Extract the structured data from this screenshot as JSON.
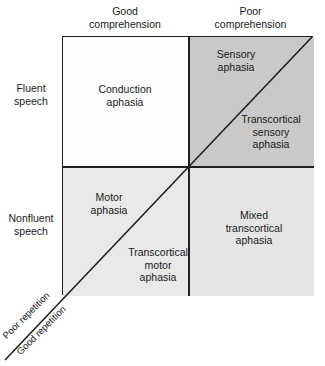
{
  "diagram": {
    "columns": [
      {
        "id": "good-comprehension",
        "label": "Good\ncomprehension"
      },
      {
        "id": "poor-comprehension",
        "label": "Poor\ncomprehension"
      }
    ],
    "rows": [
      {
        "id": "fluent-speech",
        "label": "Fluent\nspeech"
      },
      {
        "id": "nonfluent-speech",
        "label": "Nonfluent\nspeech"
      }
    ],
    "diagonal_axis": {
      "upper_label": "Poor repetition",
      "lower_label": "Good repetition"
    },
    "cells": [
      {
        "id": "conduction-aphasia",
        "label": "Conduction\naphasia",
        "row": "fluent-speech",
        "column": "good-comprehension",
        "repetition": "poor",
        "shade": "#fdfdfd"
      },
      {
        "id": "sensory-aphasia",
        "label": "Sensory\naphasia",
        "row": "fluent-speech",
        "column": "poor-comprehension",
        "repetition": "poor",
        "shade": "#c9c9c9"
      },
      {
        "id": "transcortical-sensory-aphasia",
        "label": "Transcortical\nsensory\naphasia",
        "row": "fluent-speech",
        "column": "poor-comprehension",
        "repetition": "good",
        "shade": "#c9c9c9"
      },
      {
        "id": "motor-aphasia",
        "label": "Motor\naphasia",
        "row": "nonfluent-speech",
        "column": "good-comprehension",
        "repetition": "poor",
        "shade": "#e9e9e9"
      },
      {
        "id": "transcortical-motor-aphasia",
        "label": "Transcortical\nmotor\naphasia",
        "row": "nonfluent-speech",
        "column": "good-comprehension",
        "repetition": "good",
        "shade": "#e9e9e9"
      },
      {
        "id": "mixed-transcortical-aphasia",
        "label": "Mixed\ntranscortical\naphasia",
        "row": "nonfluent-speech",
        "column": "poor-comprehension",
        "repetition": "good",
        "shade": "#e5e5e5"
      }
    ],
    "colors": {
      "line": "#231f20",
      "text": "#1a1a1a",
      "background": "#ffffff"
    }
  }
}
